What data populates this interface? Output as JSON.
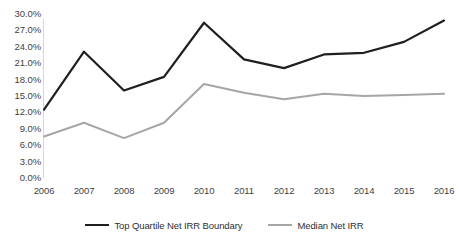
{
  "chart_data": {
    "type": "line",
    "title": "",
    "xlabel": "",
    "ylabel": "",
    "grid": false,
    "legend_position": "bottom",
    "categories": [
      "2006",
      "2007",
      "2008",
      "2009",
      "2010",
      "2011",
      "2012",
      "2013",
      "2014",
      "2015",
      "2016"
    ],
    "x": [
      2006,
      2007,
      2008,
      2009,
      2010,
      2011,
      2012,
      2013,
      2014,
      2015,
      2016
    ],
    "ylim": [
      0,
      30
    ],
    "ytick_values": [
      0,
      3,
      6,
      9,
      12,
      15,
      18,
      21,
      24,
      27,
      30
    ],
    "ytick_labels": [
      "0.0%",
      "3.0%",
      "6.0%",
      "9.0%",
      "12.0%",
      "15.0%",
      "18.0%",
      "21.0%",
      "24.0%",
      "27.0%",
      "30.0%"
    ],
    "series": [
      {
        "name": "Top Quartile Net IRR Boundary",
        "color": "#1f1f1f",
        "values": [
          12.5,
          23.1,
          16.0,
          18.5,
          28.4,
          21.7,
          20.1,
          22.6,
          22.9,
          24.9,
          28.8
        ]
      },
      {
        "name": "Median Net IRR",
        "color": "#a6a6a6",
        "values": [
          7.6,
          10.1,
          7.3,
          10.1,
          17.2,
          15.6,
          14.4,
          15.4,
          15.0,
          15.2,
          15.4
        ]
      }
    ]
  },
  "legend": {
    "entries": [
      {
        "label": "Top Quartile Net IRR Boundary",
        "color": "#1f1f1f"
      },
      {
        "label": "Median Net IRR",
        "color": "#a6a6a6"
      }
    ]
  },
  "axis": {
    "y_labels": [
      "30.0%",
      "27.0%",
      "24.0%",
      "21.0%",
      "18.0%",
      "15.0%",
      "12.0%",
      "9.0%",
      "6.0%",
      "3.0%",
      "0.0%"
    ],
    "x_labels": [
      "2006",
      "2007",
      "2008",
      "2009",
      "2010",
      "2011",
      "2012",
      "2013",
      "2014",
      "2015",
      "2016"
    ]
  },
  "colors": {
    "top_quartile_line": "#1f1f1f",
    "median_line": "#a6a6a6",
    "axis_line": "#d6d6d6",
    "tick_text": "#3f3f3f",
    "background": "#ffffff"
  }
}
